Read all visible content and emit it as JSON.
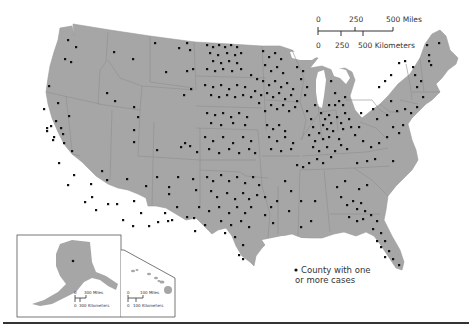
{
  "map": {
    "title": "",
    "land_color": "#a6a6a6",
    "border_color": "#8a8a8a",
    "dot_color": "#111111",
    "background": "#ffffff"
  },
  "scale_main": {
    "miles_labels": [
      "0",
      "250",
      "500 Miles"
    ],
    "km_labels": [
      "0",
      "250",
      "500 Kilometers"
    ]
  },
  "inset_alaska": {
    "miles_labels": [
      "0",
      "300 Miles"
    ],
    "km_labels": [
      "0",
      "300 Kilometers"
    ]
  },
  "inset_hawaii": {
    "miles_labels": [
      "0",
      "100 Miles"
    ],
    "km_labels": [
      "0",
      "100 Kilometers"
    ]
  },
  "legend": {
    "symbol": "●",
    "line1": "County with one",
    "line2": "or more cases"
  }
}
